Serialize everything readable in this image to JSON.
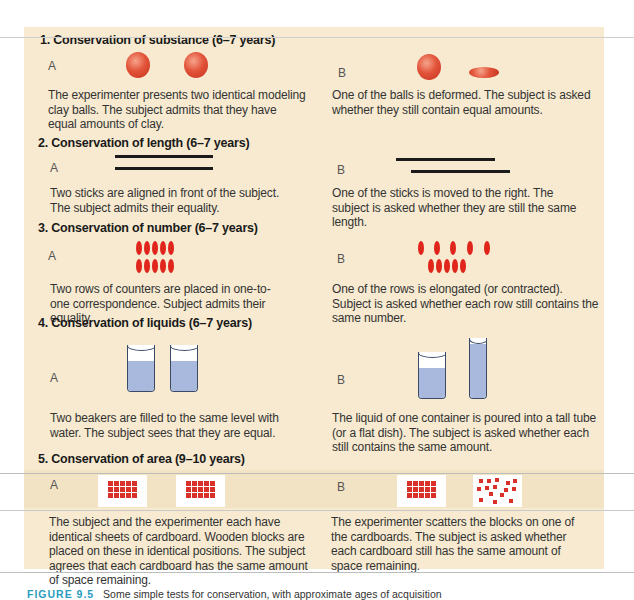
{
  "figure": {
    "caption_label": "FIGURE 9.5",
    "caption_text": "Some simple tests for conservation, with approximate ages of acquisition",
    "colors": {
      "panel_bg": "#f7ead0",
      "clay_red": "#e2543a",
      "counter_red": "#e0261c",
      "water_blue": "#a8b9dd",
      "caption_blue": "#2a9cc0"
    }
  },
  "sections": [
    {
      "title": "1. Conservation of substance (6–7 years)",
      "a": {
        "label": "A",
        "text": "The experimenter presents two identical modeling clay balls. The subject admits that they have equal amounts of clay."
      },
      "b": {
        "label": "B",
        "text": "One of the balls is deformed. The subject is asked whether they still contain equal amounts."
      }
    },
    {
      "title": "2. Conservation of length (6–7 years)",
      "a": {
        "label": "A",
        "text": "Two sticks are aligned in front of the subject. The subject admits their equality."
      },
      "b": {
        "label": "B",
        "text": "One of the sticks is moved to the right. The subject is asked whether they are still the same length."
      }
    },
    {
      "title": "3. Conservation of number (6–7 years)",
      "a": {
        "label": "A",
        "text": "Two rows of counters are placed in one-to-one correspondence. Subject admits their equality."
      },
      "b": {
        "label": "B",
        "text": "One of the rows is elongated (or contracted). Subject is asked whether each row still contains the same number."
      }
    },
    {
      "title": "4. Conservation of liquids (6–7 years)",
      "a": {
        "label": "A",
        "text": "Two beakers are filled to the same level with water. The subject sees that they are equal."
      },
      "b": {
        "label": "B",
        "text": "The liquid of one container is poured into a tall tube (or a flat dish). The subject is asked whether each still contains the same amount."
      }
    },
    {
      "title": "5. Conservation of area (9–10 years)",
      "a": {
        "label": "A",
        "text": "The subject and the experimenter each have identical sheets of cardboard. Wooden blocks are placed on these in identical positions. The subject agrees that each cardboard has the same amount of space remaining."
      },
      "b": {
        "label": "B",
        "text": "The experimenter scatters the blocks on one of the cardboards. The subject is asked whether each cardboard still has the same amount of space remaining."
      }
    }
  ]
}
